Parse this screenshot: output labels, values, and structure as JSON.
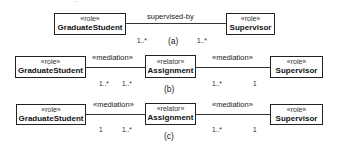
{
  "corner_mark": "ˇˇ",
  "diagram_a": {
    "caption": "(a)",
    "left": {
      "stereotype": "«role»",
      "name": "GraduateStudent"
    },
    "right": {
      "stereotype": "«role»",
      "name": "Supervisor"
    },
    "association": "supervised-by",
    "mult_left": "1..*",
    "mult_right": "1..*"
  },
  "diagram_b": {
    "caption": "(b)",
    "left": {
      "stereotype": "«role»",
      "name": "GraduateStudent"
    },
    "middle": {
      "stereotype": "«relator»",
      "name": "Assignment"
    },
    "right": {
      "stereotype": "«role»",
      "name": "Supervisor"
    },
    "assoc_left": "«mediation»",
    "assoc_right": "«mediation»",
    "mult_left_1": "1..*",
    "mult_left_2": "1..*",
    "mult_right_1": "1..*",
    "mult_right_2": "1"
  },
  "diagram_c": {
    "caption": "(c)",
    "left": {
      "stereotype": "«role»",
      "name": "GraduateStudent"
    },
    "middle": {
      "stereotype": "«relator»",
      "name": "Assignment"
    },
    "right": {
      "stereotype": "«role»",
      "name": "Supervisor"
    },
    "assoc_left": "«mediation»",
    "assoc_right": "«mediation»",
    "mult_left_1": "1",
    "mult_left_2": "1..*",
    "mult_right_1": "1..*",
    "mult_right_2": "1"
  }
}
